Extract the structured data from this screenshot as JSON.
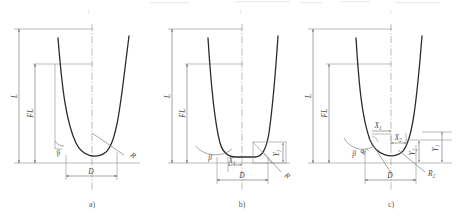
{
  "figure": {
    "type": "engineering-dimension-drawing",
    "line_color": "#7e7e7e",
    "profile_color": "#2b2b2b",
    "background": "#ffffff"
  },
  "panels": [
    {
      "id": "a",
      "caption": "a)",
      "bottom_type": "single-radius-round",
      "labels": {
        "overall_length": "L",
        "flank_length": "FL",
        "width": "D",
        "angle": "β",
        "radius": "R"
      },
      "label_list": [
        "L",
        "FL",
        "D",
        "β",
        "R"
      ]
    },
    {
      "id": "b",
      "caption": "b)",
      "bottom_type": "flat-with-corner-radius",
      "labels": {
        "overall_length": "L",
        "flank_length": "FL",
        "width": "D",
        "angle": "β",
        "radius": "R",
        "x_offset": "X",
        "x_offset_sub": "1",
        "y_offset": "Y",
        "y_offset_sub": "1"
      },
      "label_list": [
        "L",
        "FL",
        "D",
        "β",
        "R",
        "X₁",
        "Y₁"
      ]
    },
    {
      "id": "c",
      "caption": "c)",
      "bottom_type": "two-radius-compound",
      "labels": {
        "overall_length": "L",
        "flank_length": "FL",
        "width": "D",
        "angle": "β",
        "radius_1": "R",
        "radius_1_sub": "1",
        "radius_2": "R",
        "radius_2_sub": "2",
        "x1": "X",
        "x1_sub": "1",
        "x2": "X",
        "x2_sub": "2",
        "y1": "Y",
        "y1_sub": "1",
        "y2": "Y",
        "y2_sub": "2"
      },
      "label_list": [
        "L",
        "FL",
        "D",
        "β",
        "R₁",
        "R₂",
        "X₁",
        "X₂",
        "Y₁",
        "Y₂"
      ]
    }
  ]
}
